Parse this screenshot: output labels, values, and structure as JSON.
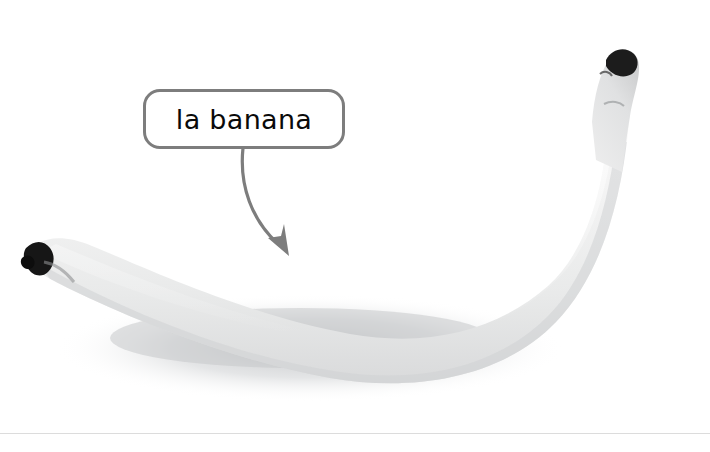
{
  "image": {
    "subject": "banana",
    "description": "Near-white desaturated photograph of a single banana lying horizontally, curving upward to the right, with its stem at the upper right and a darkened blossom tip at the left, resting on a white surface with a soft gray shadow.",
    "background_color": "#ffffff",
    "shadow_color": "#c9cacc",
    "banana_body_color": "#f2f2f2",
    "banana_shade_color": "#d8d9da",
    "banana_tip_color": "#1a1a1a",
    "stem_color": "#e6e6e6"
  },
  "callout": {
    "label": "la banana",
    "text_color": "#0a0a0a",
    "border_color": "#7d7d7d",
    "fill_color": "#ffffff",
    "border_width": "3px",
    "corner_radius": "17px"
  },
  "pointer": {
    "name": "curved-arrow",
    "color": "#7d7d7d",
    "stroke_width": "3",
    "start_x": 243,
    "start_y": 148,
    "end_x": 289,
    "end_y": 256
  },
  "divider": {
    "name": "bottom-rule",
    "color": "#dcdcdc",
    "y": 433
  }
}
